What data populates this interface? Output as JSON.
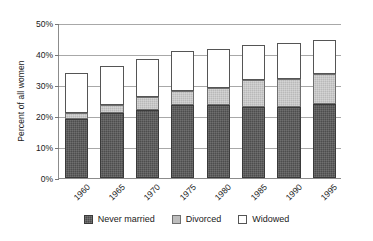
{
  "chart_data": {
    "type": "bar",
    "subtype": "stacked-bar",
    "title": "",
    "subtitle": "",
    "xlabel": "",
    "ylabel": "Percent of all women",
    "categories": [
      "1960",
      "1965",
      "1970",
      "1975",
      "1980",
      "1985",
      "1990",
      "1995"
    ],
    "series": [
      {
        "name": "Never married",
        "values": [
          19,
          21,
          22,
          23.5,
          23.5,
          23,
          23,
          24
        ],
        "color": "#4d4d4d"
      },
      {
        "name": "Divorced",
        "values": [
          2,
          2.5,
          4,
          4.5,
          5.5,
          8.5,
          9,
          9.5
        ],
        "color": "#bdbdbd"
      },
      {
        "name": "Widowed",
        "values": [
          13,
          12.5,
          12.5,
          13,
          12.5,
          11.5,
          11.5,
          11
        ],
        "color": "#ffffff"
      }
    ],
    "totals": [
      34,
      36,
      38.5,
      41,
      41.5,
      43,
      43.5,
      44.5
    ],
    "ylim": [
      0,
      50
    ],
    "yticks": [
      0,
      10,
      20,
      30,
      40,
      50
    ],
    "ytick_labels": [
      "0%",
      "10%",
      "20%",
      "30%",
      "40%",
      "50%"
    ],
    "grid": true,
    "grid_axis": "y",
    "legend_position": "bottom",
    "xtick_rotation": -45
  },
  "axes": {
    "y_title": "Percent of all women",
    "y_tick_labels": [
      "0%",
      "10%",
      "20%",
      "30%",
      "40%",
      "50%"
    ],
    "x_tick_labels": [
      "1960",
      "1965",
      "1970",
      "1975",
      "1980",
      "1985",
      "1990",
      "1995"
    ]
  },
  "legend": {
    "items": [
      {
        "label": "Never married",
        "swatch": "dark-textured-swatch"
      },
      {
        "label": "Divorced",
        "swatch": "gray-swatch"
      },
      {
        "label": "Widowed",
        "swatch": "white-swatch"
      }
    ]
  }
}
